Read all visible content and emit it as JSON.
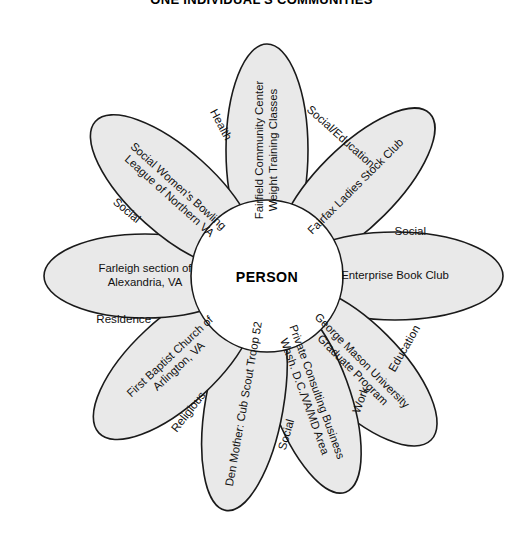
{
  "title": "ONE INDIVIDUAL'S COMMUNITIES",
  "center_label": "PERSON",
  "colors": {
    "petal_fill": "#e9e9e9",
    "petal_stroke": "#1a1a1a",
    "background": "#ffffff",
    "text": "#111111"
  },
  "chart_data": {
    "type": "diagram",
    "title": "ONE INDIVIDUAL'S COMMUNITIES",
    "layout": "radial petal / flower diagram, 8 overlapping ellipses around a white central circle",
    "center": "PERSON",
    "petals": [
      {
        "index": 0,
        "angle_deg": -90,
        "category": "Health",
        "lines": [
          "Fairfield Community Center",
          "Weight Training Classes"
        ],
        "text": "Fairfield Community Center Weight Training Classes"
      },
      {
        "index": 1,
        "angle_deg": -45,
        "category": "Social/Education",
        "lines": [
          "Fairfax Ladies Stock Club"
        ],
        "text": "Fairfax Ladies Stock Club"
      },
      {
        "index": 2,
        "angle_deg": 0,
        "category": "Social",
        "lines": [
          "Enterprise Book Club"
        ],
        "text": "Enterprise Book Club"
      },
      {
        "index": 3,
        "angle_deg": 45,
        "category": "Education",
        "lines": [
          "George Mason University",
          "Graduate Program"
        ],
        "text": "George Mason University Graduate Program"
      },
      {
        "index": 4,
        "angle_deg": 70,
        "category": "Work",
        "lines": [
          "Private Consulting Business",
          "Wash. D.C./VA/MD Area"
        ],
        "text": "Private Consulting Business Wash. D.C./VA/MD Area"
      },
      {
        "index": 5,
        "angle_deg": 100,
        "category": "Social",
        "lines": [
          "Den Mother: Cub Scout Troop 52"
        ],
        "text": "Den Mother: Cub Scout Troop 52"
      },
      {
        "index": 6,
        "angle_deg": 137,
        "category": "Religious",
        "lines": [
          "First Baptist Church of",
          "Arlington, VA"
        ],
        "text": "First Baptist Church of Arlington, VA"
      },
      {
        "index": 7,
        "angle_deg": 180,
        "category": "Residence",
        "lines": [
          "Farleigh section of",
          "Alexandria, VA"
        ],
        "text": "Farleigh section of Alexandria, VA"
      },
      {
        "index": 8,
        "angle_deg": 222,
        "category": "Social",
        "lines": [
          "Social Women's Bowling",
          "League of Northern VA"
        ],
        "text": "Social Women's Bowling League of Northern VA"
      }
    ]
  }
}
